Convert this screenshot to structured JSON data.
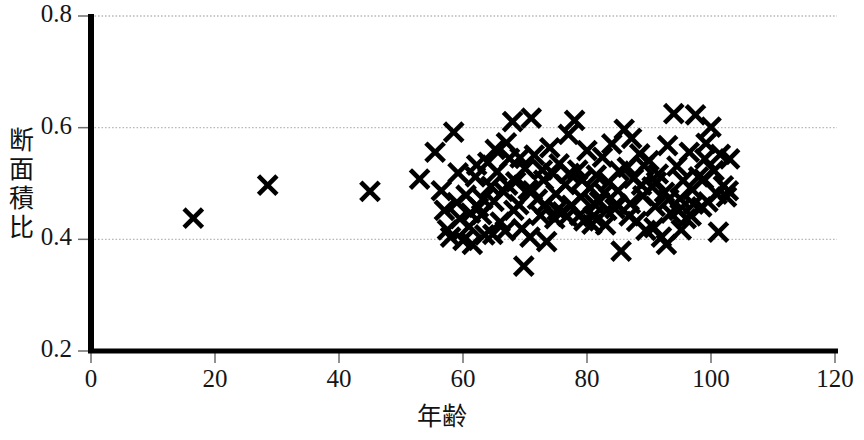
{
  "chart_data": {
    "type": "scatter",
    "title": "",
    "xlabel": "年齢",
    "ylabel": "断面積比",
    "xlim": [
      0,
      120
    ],
    "ylim": [
      0.2,
      0.8
    ],
    "xticks": [
      0,
      20,
      40,
      60,
      80,
      100,
      120
    ],
    "xtick_labels": [
      "0",
      "20",
      "40",
      "60",
      "80",
      "100",
      "120"
    ],
    "yticks": [
      0.2,
      0.4,
      0.6,
      0.8
    ],
    "ytick_labels": [
      "0.2",
      "0.4",
      "0.6",
      "0.8"
    ],
    "grid": "horizontal-dotted",
    "legend": "none",
    "marker": "x-cross",
    "marker_color": "#000000",
    "series": [
      {
        "name": "断面積比",
        "points": [
          [
            16.5,
            0.438
          ],
          [
            28.5,
            0.497
          ],
          [
            45.0,
            0.486
          ],
          [
            53.0,
            0.508
          ],
          [
            55.5,
            0.556
          ],
          [
            56.5,
            0.487
          ],
          [
            57.0,
            0.452
          ],
          [
            57.5,
            0.417
          ],
          [
            58.0,
            0.404
          ],
          [
            58.5,
            0.592
          ],
          [
            59.0,
            0.466
          ],
          [
            59.5,
            0.437
          ],
          [
            60.0,
            0.398
          ],
          [
            60.5,
            0.479
          ],
          [
            61.0,
            0.423
          ],
          [
            61.5,
            0.391
          ],
          [
            62.0,
            0.512
          ],
          [
            62.5,
            0.457
          ],
          [
            63.0,
            0.444
          ],
          [
            63.5,
            0.408
          ],
          [
            64.0,
            0.538
          ],
          [
            64.5,
            0.495
          ],
          [
            65.0,
            0.468
          ],
          [
            65.5,
            0.521
          ],
          [
            66.0,
            0.431
          ],
          [
            66.5,
            0.486
          ],
          [
            67.0,
            0.573
          ],
          [
            67.5,
            0.545
          ],
          [
            68.0,
            0.611
          ],
          [
            68.5,
            0.503
          ],
          [
            69.0,
            0.462
          ],
          [
            69.5,
            0.419
          ],
          [
            69.8,
            0.352
          ],
          [
            70.0,
            0.527
          ],
          [
            70.5,
            0.489
          ],
          [
            71.0,
            0.617
          ],
          [
            71.5,
            0.551
          ],
          [
            72.0,
            0.472
          ],
          [
            72.5,
            0.443
          ],
          [
            73.0,
            0.506
          ],
          [
            73.5,
            0.396
          ],
          [
            74.0,
            0.564
          ],
          [
            74.5,
            0.518
          ],
          [
            75.0,
            0.481
          ],
          [
            75.5,
            0.535
          ],
          [
            76.0,
            0.449
          ],
          [
            76.5,
            0.498
          ],
          [
            77.0,
            0.588
          ],
          [
            77.5,
            0.461
          ],
          [
            78.0,
            0.613
          ],
          [
            78.5,
            0.524
          ],
          [
            79.0,
            0.476
          ],
          [
            79.5,
            0.433
          ],
          [
            80.0,
            0.559
          ],
          [
            80.5,
            0.492
          ],
          [
            81.0,
            0.441
          ],
          [
            81.5,
            0.515
          ],
          [
            82.0,
            0.468
          ],
          [
            82.5,
            0.547
          ],
          [
            83.0,
            0.426
          ],
          [
            83.5,
            0.502
          ],
          [
            84.0,
            0.571
          ],
          [
            84.5,
            0.455
          ],
          [
            85.0,
            0.487
          ],
          [
            85.5,
            0.379
          ],
          [
            86.0,
            0.597
          ],
          [
            86.5,
            0.529
          ],
          [
            87.0,
            0.464
          ],
          [
            87.5,
            0.509
          ],
          [
            88.0,
            0.432
          ],
          [
            88.5,
            0.553
          ],
          [
            89.0,
            0.478
          ],
          [
            89.5,
            0.416
          ],
          [
            90.0,
            0.541
          ],
          [
            90.5,
            0.494
          ],
          [
            91.0,
            0.459
          ],
          [
            91.5,
            0.517
          ],
          [
            92.0,
            0.404
          ],
          [
            92.5,
            0.484
          ],
          [
            93.0,
            0.568
          ],
          [
            93.5,
            0.447
          ],
          [
            94.0,
            0.625
          ],
          [
            94.5,
            0.531
          ],
          [
            95.0,
            0.473
          ],
          [
            95.5,
            0.505
          ],
          [
            96.0,
            0.437
          ],
          [
            96.5,
            0.556
          ],
          [
            97.0,
            0.489
          ],
          [
            97.5,
            0.623
          ],
          [
            98.0,
            0.512
          ],
          [
            98.5,
            0.458
          ],
          [
            99.0,
            0.544
          ],
          [
            99.5,
            0.467
          ],
          [
            100.0,
            0.601
          ],
          [
            100.5,
            0.523
          ],
          [
            101.0,
            0.481
          ],
          [
            101.5,
            0.552
          ],
          [
            102.0,
            0.496
          ],
          [
            102.5,
            0.476
          ],
          [
            103.0,
            0.544
          ],
          [
            62.2,
            0.533
          ],
          [
            64.8,
            0.409
          ],
          [
            66.8,
            0.415
          ],
          [
            68.2,
            0.452
          ],
          [
            70.8,
            0.404
          ],
          [
            72.8,
            0.524
          ],
          [
            74.8,
            0.437
          ],
          [
            76.8,
            0.441
          ],
          [
            78.8,
            0.443
          ],
          [
            80.8,
            0.427
          ],
          [
            82.8,
            0.483
          ],
          [
            84.8,
            0.463
          ],
          [
            86.8,
            0.442
          ],
          [
            88.8,
            0.497
          ],
          [
            90.8,
            0.421
          ],
          [
            92.8,
            0.391
          ],
          [
            94.8,
            0.452
          ],
          [
            96.8,
            0.442
          ],
          [
            98.8,
            0.508
          ],
          [
            65.2,
            0.561
          ],
          [
            67.2,
            0.497
          ],
          [
            69.2,
            0.546
          ],
          [
            71.2,
            0.487
          ],
          [
            73.2,
            0.462
          ],
          [
            75.2,
            0.452
          ],
          [
            77.2,
            0.518
          ],
          [
            79.2,
            0.506
          ],
          [
            81.2,
            0.463
          ],
          [
            83.2,
            0.452
          ],
          [
            85.2,
            0.522
          ],
          [
            87.2,
            0.581
          ],
          [
            89.2,
            0.532
          ],
          [
            91.2,
            0.503
          ],
          [
            93.2,
            0.472
          ],
          [
            95.2,
            0.417
          ],
          [
            97.2,
            0.463
          ],
          [
            99.2,
            0.572
          ],
          [
            101.2,
            0.413
          ],
          [
            63.2,
            0.472
          ],
          [
            61.2,
            0.447
          ],
          [
            59.2,
            0.519
          ],
          [
            102.8,
            0.487
          ]
        ]
      }
    ]
  },
  "axes": {
    "y_title_chars": [
      "断",
      "面",
      "積",
      "比"
    ],
    "x_title": "年齢"
  }
}
